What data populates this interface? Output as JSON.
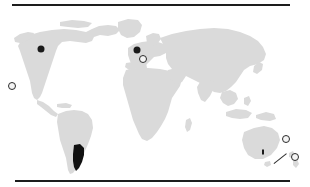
{
  "figure": {
    "kind": "world-distribution-map",
    "background_color": "#ffffff",
    "land_color": "#dadada",
    "highlight_color": "#111111",
    "marker_color": "#1a1a1a",
    "rule_color": "#1d1d1d",
    "top_rule": {
      "x": 12,
      "y": 4,
      "width": 278,
      "height": 2
    },
    "bottom_rule": {
      "x": 15,
      "y": 180,
      "width": 275,
      "height": 2
    }
  },
  "map": {
    "projection_note": "equirectangular world outline",
    "highlighted_regions": [
      {
        "name": "southern-south-america",
        "label": "",
        "color": "#111111"
      }
    ]
  },
  "markers": [
    {
      "name": "marker-pacific-west",
      "style": "ring",
      "x": 12,
      "y": 86,
      "size": 6,
      "label": ""
    },
    {
      "name": "marker-north-america-west",
      "style": "solid",
      "x": 41,
      "y": 49,
      "size": 7,
      "label": ""
    },
    {
      "name": "marker-western-europe",
      "style": "solid",
      "x": 137,
      "y": 50,
      "size": 7,
      "label": ""
    },
    {
      "name": "marker-southern-europe",
      "style": "ring",
      "x": 143,
      "y": 59,
      "size": 6,
      "label": ""
    },
    {
      "name": "marker-australia-southeast",
      "style": "tick",
      "x": 263,
      "y": 152,
      "size": 5,
      "label": ""
    },
    {
      "name": "marker-new-zealand-north",
      "style": "ring",
      "x": 286,
      "y": 139,
      "size": 6,
      "label": ""
    },
    {
      "name": "marker-new-zealand-south",
      "style": "ring",
      "x": 295,
      "y": 157,
      "size": 6,
      "label": ""
    }
  ],
  "annotations": {
    "leader_lines": [
      {
        "name": "leader-new-zealand",
        "x": 274,
        "y": 163,
        "length": 16,
        "angle": -38
      }
    ]
  }
}
